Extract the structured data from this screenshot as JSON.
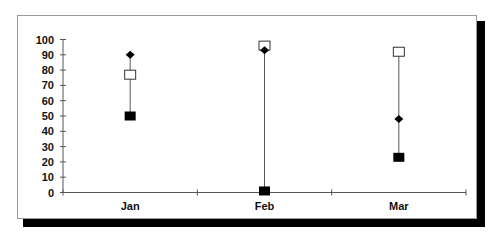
{
  "chart_data": {
    "type": "scatter",
    "subtype": "high-low-close",
    "title": "",
    "xlabel": "",
    "ylabel": "",
    "categories": [
      "Jan",
      "Feb",
      "Mar"
    ],
    "series": [
      {
        "name": "Open (hollow square)",
        "marker": "square-open",
        "values": [
          77,
          96,
          92
        ]
      },
      {
        "name": "Close (diamond)",
        "marker": "diamond",
        "values": [
          90,
          93,
          48
        ]
      },
      {
        "name": "Low (filled square)",
        "marker": "square-filled",
        "values": [
          50,
          1,
          23
        ]
      }
    ],
    "ylim": [
      0,
      100
    ],
    "yticks": [
      0,
      10,
      20,
      30,
      40,
      50,
      60,
      70,
      80,
      90,
      100
    ],
    "grid": false,
    "legend": "none",
    "hi_lo_lines": true
  },
  "colors": {
    "marker": "#000000",
    "line": "#555555",
    "shadow": "#000000",
    "frame_border": "#9a9a9a"
  }
}
